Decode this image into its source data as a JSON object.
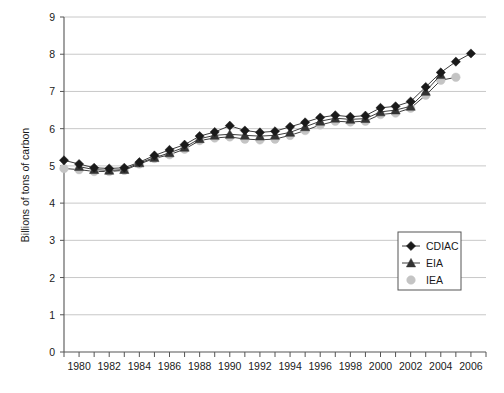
{
  "chart_data": {
    "type": "line",
    "title": "",
    "xlabel": "",
    "ylabel": "Billions of tons of carbon",
    "xlim": [
      1979,
      2007
    ],
    "ylim": [
      0,
      9
    ],
    "ytick_labels": [
      "0",
      "1",
      "2",
      "3",
      "4",
      "5",
      "6",
      "7",
      "8",
      "9"
    ],
    "ytick_values": [
      0,
      1,
      2,
      3,
      4,
      5,
      6,
      7,
      8,
      9
    ],
    "xtick_labels": [
      "1980",
      "1982",
      "1984",
      "1986",
      "1988",
      "1990",
      "1992",
      "1994",
      "1996",
      "1998",
      "2000",
      "2002",
      "2004",
      "2006"
    ],
    "xtick_values": [
      1980,
      1982,
      1984,
      1986,
      1988,
      1990,
      1992,
      1994,
      1996,
      1998,
      2000,
      2002,
      2004,
      2006
    ],
    "xtick_minor_values": [
      1979,
      1981,
      1983,
      1985,
      1987,
      1989,
      1991,
      1993,
      1995,
      1997,
      1999,
      2001,
      2003,
      2005,
      2007
    ],
    "grid": "horizontal",
    "legend_position": "lower-right-inside",
    "series": [
      {
        "name": "CDIAC",
        "marker": "diamond",
        "color": "#1a1a1a",
        "x": [
          1979,
          1980,
          1981,
          1982,
          1983,
          1984,
          1985,
          1986,
          1987,
          1988,
          1989,
          1990,
          1991,
          1992,
          1993,
          1994,
          1995,
          1996,
          1997,
          1998,
          1999,
          2000,
          2001,
          2002,
          2003,
          2004,
          2005,
          2006
        ],
        "values": [
          5.15,
          5.05,
          4.95,
          4.93,
          4.95,
          5.1,
          5.28,
          5.43,
          5.57,
          5.8,
          5.91,
          6.08,
          5.95,
          5.9,
          5.93,
          6.05,
          6.17,
          6.3,
          6.36,
          6.32,
          6.35,
          6.56,
          6.6,
          6.73,
          7.12,
          7.51,
          7.8,
          8.02
        ]
      },
      {
        "name": "EIA",
        "marker": "triangle",
        "color": "#333333",
        "x": [
          1980,
          1981,
          1982,
          1983,
          1984,
          1985,
          1986,
          1987,
          1988,
          1989,
          1990,
          1991,
          1992,
          1993,
          1994,
          1995,
          1996,
          1997,
          1998,
          1999,
          2000,
          2001,
          2002,
          2003,
          2004
        ],
        "values": [
          4.98,
          4.9,
          4.88,
          4.9,
          5.08,
          5.22,
          5.35,
          5.5,
          5.73,
          5.82,
          5.85,
          5.82,
          5.8,
          5.82,
          5.9,
          6.05,
          6.2,
          6.28,
          6.25,
          6.27,
          6.45,
          6.5,
          6.6,
          7.0,
          7.45
        ]
      },
      {
        "name": "IEA",
        "marker": "circle",
        "color": "#c4c4c4",
        "x": [
          1979,
          1980,
          1981,
          1982,
          1983,
          1984,
          1985,
          1986,
          1987,
          1988,
          1989,
          1990,
          1991,
          1992,
          1993,
          1994,
          1995,
          1996,
          1997,
          1998,
          1999,
          2000,
          2001,
          2002,
          2003,
          2004,
          2005
        ],
        "values": [
          4.93,
          4.9,
          4.85,
          4.85,
          4.88,
          5.05,
          5.2,
          5.3,
          5.45,
          5.68,
          5.75,
          5.78,
          5.72,
          5.7,
          5.72,
          5.82,
          5.95,
          6.1,
          6.2,
          6.18,
          6.2,
          6.38,
          6.42,
          6.55,
          6.9,
          7.3,
          7.38
        ]
      }
    ]
  },
  "legend": {
    "items": [
      {
        "label": "CDIAC",
        "marker": "diamond",
        "color": "#1a1a1a"
      },
      {
        "label": "EIA",
        "marker": "triangle",
        "color": "#333333"
      },
      {
        "label": "IEA",
        "marker": "circle",
        "color": "#c4c4c4"
      }
    ]
  },
  "colors": {
    "grid": "#c8c8c8",
    "axis": "#555555",
    "background": "#ffffff",
    "text": "#1a1a1a"
  }
}
